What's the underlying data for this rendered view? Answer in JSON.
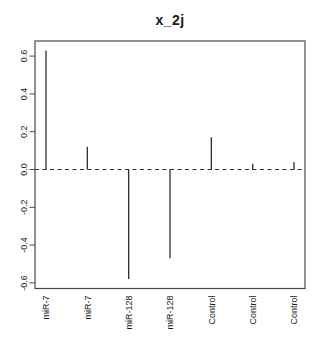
{
  "title": "x_2j",
  "chart_data": {
    "type": "bar",
    "subtype": "stem",
    "title": "x_2j",
    "categories": [
      "miR-7",
      "miR-7",
      "miR-128",
      "miR-128",
      "Control",
      "Control",
      "Control"
    ],
    "values": [
      0.63,
      0.12,
      -0.58,
      -0.47,
      0.17,
      0.03,
      0.04
    ],
    "xlabel": "",
    "ylabel": "",
    "ylim": [
      -0.63,
      0.68
    ],
    "ytick_values": [
      0.6,
      0.4,
      0.2,
      0.0,
      -0.2,
      -0.4,
      -0.6
    ],
    "ytick_labels": [
      "0.6",
      "0.4",
      "0.2",
      "0.0",
      "-0.2",
      "-0.4",
      "-0.6"
    ],
    "zero_line_style": "dashed",
    "grid": false,
    "legend_position": "none"
  },
  "colors": {
    "background": "#ffffff",
    "axis": "#4a4a4a",
    "stem": "#2e2e2e",
    "zero_line": "#2e2e2e",
    "text": "#1a1a1a"
  }
}
